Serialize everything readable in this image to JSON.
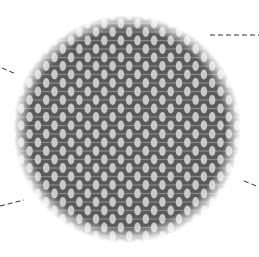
{
  "figure": {
    "circle": {
      "cx": 127,
      "cy": 129,
      "r": 114
    },
    "mesh": {
      "background_color": "#5a5a5a",
      "cell_color": "#c9c9c9",
      "strand_color": "#8a8a8a",
      "cell_width": 6.5,
      "cell_height": 10,
      "column_pitch": 16.6,
      "row_pitch": 17,
      "stagger_x": 8.3,
      "stagger_y": 8.5
    },
    "leader_lines": [
      {
        "name": "leader-top-right",
        "x1": 210,
        "y1": 35,
        "x2": 259,
        "y2": 35
      },
      {
        "name": "leader-upper-left",
        "x1": 2,
        "y1": 68,
        "x2": 16,
        "y2": 74
      },
      {
        "name": "leader-lower-left",
        "x1": 0,
        "y1": 206,
        "x2": 24,
        "y2": 200
      },
      {
        "name": "leader-lower-right",
        "x1": 244,
        "y1": 181,
        "x2": 259,
        "y2": 187
      }
    ],
    "leader_color": "#333333"
  }
}
